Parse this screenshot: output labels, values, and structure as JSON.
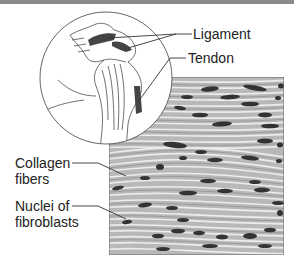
{
  "figure": {
    "labels": {
      "ligament": "Ligament",
      "tendon": "Tendon",
      "collagen_line1": "Collagen",
      "collagen_line2": "fibers",
      "nuclei_line1": "Nuclei of",
      "nuclei_line2": "fibroblasts"
    },
    "colors": {
      "topbar": "#8a8a8a",
      "tissue_bg": "#b5b5b5",
      "fiber": "#e6e6e6",
      "nucleus": "#333333",
      "line": "#333333"
    }
  }
}
